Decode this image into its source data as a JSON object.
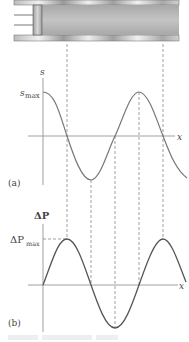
{
  "figure": {
    "tube": {
      "description": "piston in tube with compressions and rarefactions"
    },
    "panel_a": {
      "label": "(a)",
      "y_axis_label": "s",
      "max_label": "s",
      "max_subscript": "max",
      "x_axis_label": "x",
      "curve": "s = s_max cos(kx)"
    },
    "panel_b": {
      "label": "(b)",
      "y_axis_label": "ΔP",
      "max_label": "ΔP",
      "max_subscript": "max",
      "x_axis_label": "x",
      "curve": "ΔP = ΔP_max sin(kx)"
    },
    "dashed_guides_x": [
      67,
      91,
      115,
      139,
      163
    ]
  }
}
